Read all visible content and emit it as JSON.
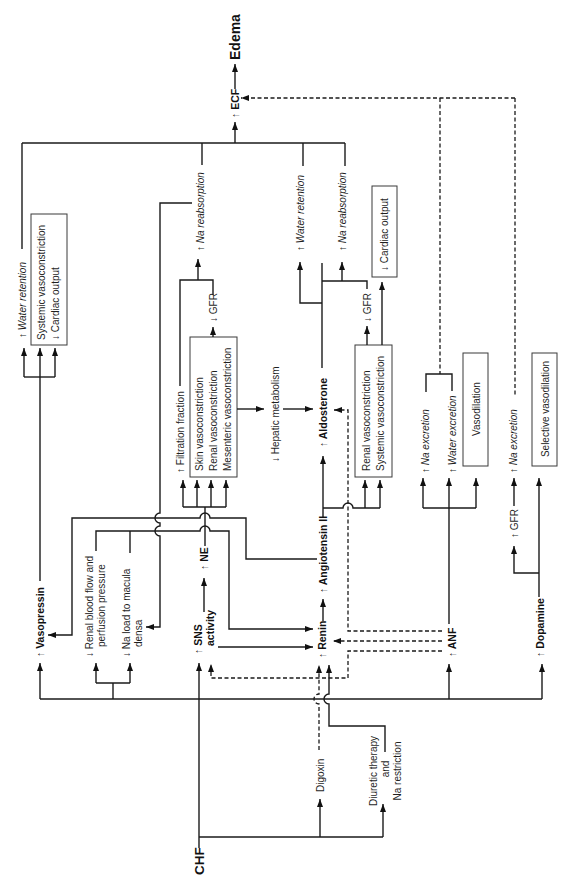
{
  "figure": {
    "type": "flowchart",
    "orientation": "rotated 90 degrees counterclockwise (labels read bottom-to-top)"
  },
  "nodes": {
    "chf": "CHF",
    "edema": "Edema",
    "ecf": "↑ ECF",
    "vasopressin": "↑ Vasopressin",
    "renal_blood_flow": {
      "line1": "↓ Renal blood flow and",
      "line2": "perfusion pressure"
    },
    "na_load_macula_densa": {
      "line1": "↓ Na load to macula",
      "line2": "densa"
    },
    "sns_activity": {
      "line1": "↑ SNS",
      "line2": "activity"
    },
    "ne": "↑ NE",
    "renin": "↑ Renin",
    "angiotensin_ii": "↑ Angiotensin II",
    "aldosterone": "↑ Aldosterone",
    "hepatic_metabolism": "↓ Hepatic metabolism",
    "anf": "↑ ANF",
    "dopamine": "↑ Dopamine",
    "digoxin": "Digoxin",
    "diuretic": {
      "line1": "Diuretic therapy",
      "line2": "and",
      "line3": "Na restriction"
    }
  },
  "effects": {
    "vasopressin": {
      "water_retention": "↑ Water retention",
      "box": [
        "Systemic vasoconstriction",
        "↓ Cardiac output"
      ]
    },
    "ne": {
      "filtration_fraction": "↑ Filtration fraction",
      "box": [
        "Skin vasoconstriction",
        "Renal vasoconstriction",
        "Mesenteric vasoconstriction"
      ],
      "gfr": "↓ GFR",
      "na_reabsorption": "↑ Na reabsorption"
    },
    "aldosterone": {
      "water_retention": "↑ Water retention",
      "na_reabsorption": "↑ Na reabsorption"
    },
    "angiotensin_ii": {
      "box": [
        "Renal vasoconstriction",
        "Systemic vasoconstriction"
      ],
      "gfr": "↓ GFR",
      "cardiac_output": "↓ Cardiac output"
    },
    "anf": {
      "na_excretion": "↑ Na excretion",
      "water_excretion": "↑ Water excretion",
      "vasodilation": "Vasodilation"
    },
    "dopamine": {
      "gfr": "↑ GFR",
      "na_excretion": "↑ Na excretion",
      "selective_vasodilation": "Selective vasodilation"
    }
  },
  "edges": [
    {
      "from": "CHF",
      "to": "Vasopressin",
      "style": "solid"
    },
    {
      "from": "CHF",
      "to": "Renal blood flow and perfusion pressure",
      "style": "solid"
    },
    {
      "from": "CHF",
      "to": "Na load to macula densa",
      "style": "solid"
    },
    {
      "from": "CHF",
      "to": "SNS activity",
      "style": "solid"
    },
    {
      "from": "CHF",
      "to": "ANF",
      "style": "solid"
    },
    {
      "from": "CHF",
      "to": "Dopamine",
      "style": "solid"
    },
    {
      "from": "CHF",
      "to": "Digoxin",
      "style": "solid"
    },
    {
      "from": "CHF",
      "to": "Diuretic therapy and Na restriction",
      "style": "solid"
    },
    {
      "from": "Digoxin",
      "to": "Renin",
      "style": "dashed"
    },
    {
      "from": "Diuretic therapy and Na restriction",
      "to": "Renin",
      "style": "solid"
    },
    {
      "from": "Renal blood flow and perfusion pressure",
      "to": "Renin",
      "style": "solid"
    },
    {
      "from": "Na load to macula densa",
      "to": "Renin",
      "style": "solid"
    },
    {
      "from": "SNS activity",
      "to": "Renin",
      "style": "solid"
    },
    {
      "from": "SNS activity",
      "to": "NE",
      "style": "solid"
    },
    {
      "from": "NE",
      "to": "Filtration fraction",
      "style": "solid"
    },
    {
      "from": "NE",
      "to": "Skin/Renal/Mesenteric vasoconstriction",
      "style": "solid"
    },
    {
      "from": "Skin/Renal/Mesenteric vasoconstriction",
      "to": "GFR",
      "style": "solid"
    },
    {
      "from": "Skin/Renal/Mesenteric vasoconstriction",
      "to": "Hepatic metabolism",
      "style": "solid"
    },
    {
      "from": "Filtration fraction",
      "to": "Na reabsorption",
      "style": "solid"
    },
    {
      "from": "GFR",
      "to": "Na reabsorption",
      "style": "solid"
    },
    {
      "from": "Na reabsorption",
      "to": "Na load to macula densa",
      "style": "solid"
    },
    {
      "from": "Renin",
      "to": "Angiotensin II",
      "style": "solid"
    },
    {
      "from": "Angiotensin II",
      "to": "Vasopressin",
      "style": "solid"
    },
    {
      "from": "Angiotensin II",
      "to": "Aldosterone",
      "style": "solid"
    },
    {
      "from": "Angiotensin II",
      "to": "Renal/Systemic vasoconstriction",
      "style": "solid"
    },
    {
      "from": "Hepatic metabolism",
      "to": "Aldosterone",
      "style": "solid"
    },
    {
      "from": "Aldosterone",
      "to": "Water retention",
      "style": "solid"
    },
    {
      "from": "Aldosterone",
      "to": "Na reabsorption",
      "style": "solid"
    },
    {
      "from": "Renal/Systemic vasoconstriction",
      "to": "GFR",
      "style": "solid"
    },
    {
      "from": "Renal/Systemic vasoconstriction",
      "to": "Cardiac output",
      "style": "solid"
    },
    {
      "from": "Vasopressin",
      "to": "Water retention",
      "style": "solid"
    },
    {
      "from": "Vasopressin",
      "to": "Systemic vasoconstriction / Cardiac output",
      "style": "solid"
    },
    {
      "from": "Water retention / Na reabsorption",
      "to": "ECF",
      "style": "solid"
    },
    {
      "from": "ECF",
      "to": "Edema",
      "style": "solid"
    },
    {
      "from": "ANF",
      "to": "Na excretion",
      "style": "solid"
    },
    {
      "from": "ANF",
      "to": "Water excretion",
      "style": "solid"
    },
    {
      "from": "ANF",
      "to": "Vasodilation",
      "style": "solid"
    },
    {
      "from": "ANF",
      "to": "Renin",
      "style": "dashed"
    },
    {
      "from": "ANF",
      "to": "Aldosterone",
      "style": "dashed"
    },
    {
      "from": "ANF",
      "to": "SNS activity",
      "style": "dashed"
    },
    {
      "from": "Na excretion / Water excretion (ANF)",
      "to": "ECF",
      "style": "dashed"
    },
    {
      "from": "Dopamine",
      "to": "GFR",
      "style": "solid"
    },
    {
      "from": "GFR (dopamine)",
      "to": "Na excretion",
      "style": "solid"
    },
    {
      "from": "Dopamine",
      "to": "Selective vasodilation",
      "style": "solid"
    },
    {
      "from": "Na excretion (dopamine)",
      "to": "ECF",
      "style": "dashed"
    }
  ],
  "colors": {
    "line": "#1a1a1a",
    "text": "#1f1f1f",
    "background": "#ffffff"
  }
}
